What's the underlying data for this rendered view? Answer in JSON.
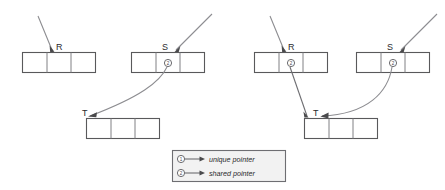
{
  "figure": {
    "title": ""
  },
  "panels": [
    {
      "id": "left",
      "boxes": [
        {
          "id": "left-R",
          "label": "R",
          "cells": 3,
          "pointer_symbol": null,
          "pointer_type": "unique"
        },
        {
          "id": "left-S",
          "label": "S",
          "cells": 3,
          "pointer_symbol": "2",
          "pointer_type": "shared"
        },
        {
          "id": "left-T",
          "label": "T",
          "cells": 3,
          "pointer_symbol": null,
          "pointer_type": "target"
        }
      ],
      "arrows": [
        {
          "id": "left-into-R",
          "from": "external",
          "to": "left-R",
          "style": "straight"
        },
        {
          "id": "left-into-S",
          "from": "external",
          "to": "left-S",
          "style": "straight"
        },
        {
          "id": "left-S-to-T",
          "from": "left-S",
          "to": "left-T",
          "style": "curved"
        }
      ]
    },
    {
      "id": "right",
      "boxes": [
        {
          "id": "right-R",
          "label": "R",
          "cells": 3,
          "pointer_symbol": "2",
          "pointer_type": "shared"
        },
        {
          "id": "right-S",
          "label": "S",
          "cells": 3,
          "pointer_symbol": "2",
          "pointer_type": "shared"
        },
        {
          "id": "right-T",
          "label": "T",
          "cells": 3,
          "pointer_symbol": null,
          "pointer_type": "target"
        }
      ],
      "arrows": [
        {
          "id": "right-into-R",
          "from": "external",
          "to": "right-R",
          "style": "straight"
        },
        {
          "id": "right-into-S",
          "from": "external",
          "to": "right-S",
          "style": "straight"
        },
        {
          "id": "right-R-to-T",
          "from": "right-R",
          "to": "right-T",
          "style": "straight"
        },
        {
          "id": "right-S-to-T",
          "from": "right-S",
          "to": "right-T",
          "style": "curved"
        }
      ]
    }
  ],
  "legend": {
    "entries": [
      {
        "symbol": "1",
        "label": "unique pointer"
      },
      {
        "symbol": "2",
        "label": "shared pointer"
      }
    ]
  },
  "colors": {
    "box_stroke": "#59595b",
    "cell_divider": "#808084",
    "arrow_line": "#8d8d91",
    "arrow_head": "#4a4a4c",
    "legend_fill": "#f2f2f2",
    "text": "#2b2b2d",
    "background": "#ffffff"
  }
}
